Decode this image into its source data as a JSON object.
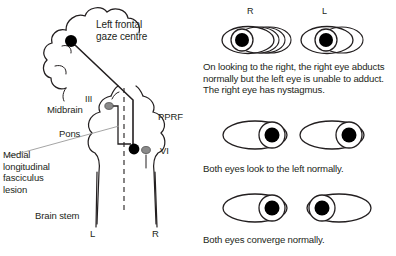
{
  "figure": {
    "title_hidden": "",
    "brain_diagram": {
      "labels": {
        "gaze_centre": "Left frontal\ngaze centre",
        "cn3": "III",
        "midbrain": "Midbrain",
        "pons": "Pons",
        "pprf": "PPRF",
        "cn6": "VI",
        "mlf_lesion": "Medial\nlongitudinal\nfasciculus\nlesion",
        "brain_stem": "Brain stem",
        "left_nerve": "L",
        "right_nerve": "R"
      },
      "colors": {
        "outline": "#231f20",
        "lesion_dot": "#000000",
        "nucleus_dot": "#8a8a8a",
        "leader_line": "#9a9a9a",
        "pathway": "#231f20"
      }
    },
    "eye_panels": [
      {
        "id": "panel-gaze-right",
        "eye_labels": {
          "right": "R",
          "left": "L"
        },
        "caption": "On looking to the right, the right eye abducts normally but the left eye is unable to adduct. The right eye has nystagmus.",
        "right_eye": {
          "pupil_position": "left",
          "nystagmus": true,
          "trail_count": 3
        },
        "left_eye": {
          "pupil_position": "center",
          "nystagmus": false,
          "trail_count": 1
        }
      },
      {
        "id": "panel-gaze-left",
        "caption": "Both eyes look to the left normally.",
        "right_eye": {
          "pupil_position": "right",
          "nystagmus": false,
          "trail_count": 0
        },
        "left_eye": {
          "pupil_position": "right",
          "nystagmus": false,
          "trail_count": 0
        }
      },
      {
        "id": "panel-convergence",
        "caption": "Both eyes converge normally.",
        "right_eye": {
          "pupil_position": "right",
          "nystagmus": false,
          "trail_count": 0
        },
        "left_eye": {
          "pupil_position": "left",
          "nystagmus": false,
          "trail_count": 0
        }
      }
    ],
    "colors": {
      "ink": "#231f20",
      "pupil": "#000000",
      "background": "#ffffff"
    }
  }
}
